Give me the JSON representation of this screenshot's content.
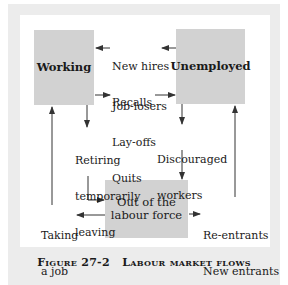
{
  "boxes": {
    "working": "Working",
    "unemployed": "Unemployed",
    "out_of_labour_force_line1": "Out of the",
    "out_of_labour_force_line2": "labour force"
  },
  "flows": {
    "unemployed_to_working": [
      "New hires",
      "Recalls"
    ],
    "working_to_unemployed": [
      "Job-losers",
      "Lay-offs",
      "Quits"
    ],
    "working_to_out": [
      "Retiring",
      "temporarily",
      "leaving"
    ],
    "unemployed_to_out": [
      "Discouraged",
      "workers"
    ],
    "out_to_working": [
      "Taking",
      "a job"
    ],
    "out_to_unemployed": [
      "Re-entrants",
      "New entrants"
    ]
  },
  "caption": {
    "figure": "Figure 27-2",
    "title": "Labour market flows"
  },
  "colors": {
    "box_fill": "#d2d2d2",
    "frame": "#ececec",
    "panel": "#ffffff",
    "line": "#333333"
  }
}
